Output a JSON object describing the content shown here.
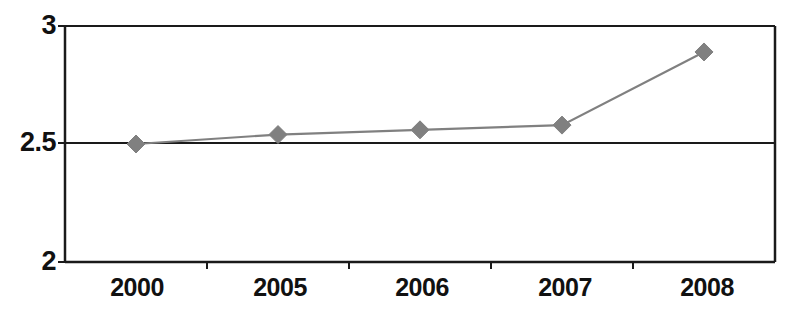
{
  "chart_data": {
    "type": "line",
    "title": "",
    "subtitle": "",
    "xlabel": "",
    "ylabel": "",
    "categories": [
      "2000",
      "2005",
      "2006",
      "2007",
      "2008"
    ],
    "values": [
      2.5,
      2.54,
      2.56,
      2.58,
      2.89
    ],
    "series": [
      {
        "name": "",
        "values": [
          2.5,
          2.54,
          2.56,
          2.58,
          2.89
        ],
        "marker": "diamond",
        "marker_color": "#808080",
        "line_color": "#808080"
      }
    ],
    "ylim": [
      2,
      3
    ],
    "y_ticks": [
      "2",
      "2.5",
      "3"
    ],
    "y_tick_values": [
      2,
      2.5,
      3
    ],
    "x_ticks": [
      "2000",
      "2005",
      "2006",
      "2007",
      "2008"
    ],
    "grid": true,
    "grid_axis": "y",
    "legend": false,
    "legend_position": "none"
  },
  "axes": {
    "y_labels": [
      "3",
      "2.5",
      "2"
    ],
    "x_labels": [
      "2000",
      "2005",
      "2006",
      "2007",
      "2008"
    ]
  },
  "colors": {
    "axis": "#1a1a1a",
    "grid": "#1a1a1a",
    "series": "#808080",
    "background": "#ffffff",
    "text": "#111111"
  }
}
